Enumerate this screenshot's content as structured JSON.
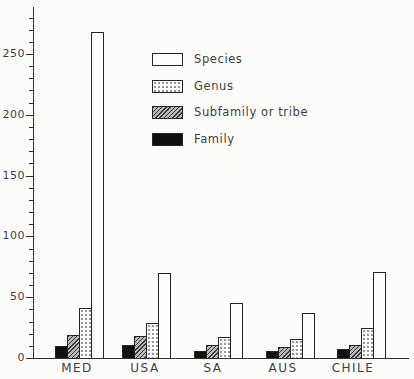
{
  "chart_data": {
    "type": "bar",
    "title": "",
    "xlabel": "",
    "ylabel": "",
    "categories": [
      "MED",
      "USA",
      "SA",
      "AUS",
      "CHILE"
    ],
    "series": [
      {
        "name": "Family",
        "pattern": "family",
        "values": [
          10,
          11,
          6,
          6,
          7
        ]
      },
      {
        "name": "Subfamily or tribe",
        "pattern": "subfamily",
        "values": [
          19,
          18,
          11,
          9,
          11
        ]
      },
      {
        "name": "Genus",
        "pattern": "genus",
        "values": [
          41,
          29,
          17,
          16,
          25
        ]
      },
      {
        "name": "Species",
        "pattern": "species",
        "values": [
          268,
          70,
          45,
          37,
          71
        ]
      }
    ],
    "ylim": [
      0,
      280
    ],
    "y_major_ticks": [
      0,
      50,
      100,
      150,
      200,
      250
    ],
    "y_tick_labels": [
      "0",
      "50",
      "100",
      "150",
      "200",
      "250"
    ],
    "y_minor_step": 10,
    "grid": "off",
    "legend_position": "upper-center",
    "legend": {
      "items": [
        {
          "label": "Species",
          "pattern": "species"
        },
        {
          "label": "Genus",
          "pattern": "genus"
        },
        {
          "label": "Subfamily or tribe",
          "pattern": "subfamily"
        },
        {
          "label": "Family",
          "pattern": "family"
        }
      ]
    },
    "colors": {
      "ink": "#2f2f2f",
      "bar_black": "#101010",
      "hatch_gray": "#b7b7b7",
      "dot_gray": "#929292",
      "background": "#fcfcfa"
    }
  }
}
